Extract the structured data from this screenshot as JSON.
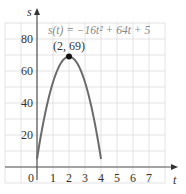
{
  "chart_data": {
    "type": "line",
    "title": "",
    "equation": "s(t) = −16t² + 64t + 5",
    "xlabel": "t",
    "ylabel": "s",
    "x_ticks": [
      "0",
      "1",
      "2",
      "3",
      "4",
      "5",
      "6",
      "7"
    ],
    "y_ticks": [
      "20",
      "40",
      "60",
      "80"
    ],
    "xlim": [
      -2,
      8
    ],
    "ylim": [
      -10,
      90
    ],
    "grid": true,
    "annotation": {
      "label": "(2, 69)",
      "x": 2,
      "y": 69
    },
    "series": [
      {
        "name": "s(t)",
        "x": [
          0,
          0.5,
          1,
          1.5,
          2,
          2.5,
          3,
          3.5,
          4.0
        ],
        "y": [
          5,
          33,
          53,
          65,
          69,
          65,
          53,
          33,
          5
        ]
      }
    ],
    "colors": {
      "curve": "#6b6b6b",
      "grid": "#dcdcdc",
      "axis": "#555555",
      "point": "#111111"
    }
  }
}
